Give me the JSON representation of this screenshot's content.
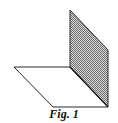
{
  "figure": {
    "caption": "Fig. 1",
    "colors": {
      "stroke": "#2a2a2a",
      "shade_fg": "#6e6e6e",
      "shade_bg": "#d8d8d8",
      "horizontal_fill": "#ffffff"
    },
    "planes": {
      "vertical": {
        "label": "shaded vertical half-plane",
        "points": "70,10 108,50 108,107 70,67"
      },
      "horizontal": {
        "label": "horizontal half-plane",
        "points": "14,67 70,67 108,107 53,107"
      }
    }
  }
}
